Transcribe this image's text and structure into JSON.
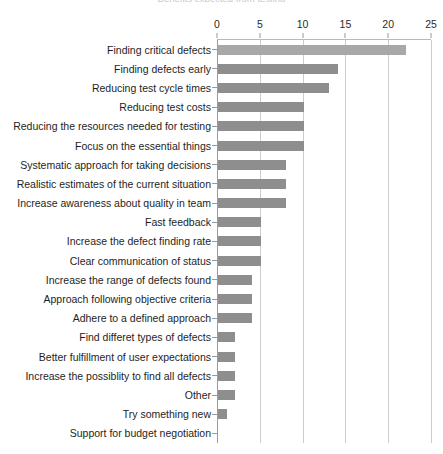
{
  "title": "Benefits expected from testing",
  "axis": {
    "ticks": [
      {
        "value": 0,
        "label": "0"
      },
      {
        "value": 5,
        "label": "5"
      },
      {
        "value": 10,
        "label": "10"
      },
      {
        "value": 15,
        "label": "15"
      },
      {
        "value": 20,
        "label": "20"
      },
      {
        "value": 25,
        "label": "25"
      }
    ]
  },
  "colors": {
    "bar": "#8e8e8e",
    "bar_light": "#a8a8a8",
    "grid": "#cccccc",
    "axis": "#9a9a9a",
    "text": "#1e1e1e"
  },
  "chart_data": {
    "type": "bar",
    "orientation": "horizontal",
    "title": "",
    "xlabel": "",
    "ylabel": "",
    "xlim": [
      0,
      25
    ],
    "grid": true,
    "legend": "none",
    "categories": [
      "Finding critical defects",
      "Finding defects early",
      "Reducing test cycle times",
      "Reducing test costs",
      "Reducing the resources needed for testing",
      "Focus on the essential things",
      "Systematic approach for taking decisions",
      "Realistic estimates of the current situation",
      "Increase awareness about quality in team",
      "Fast feedback",
      "Increase the defect finding rate",
      "Clear communication of status",
      "Increase the range of defects found",
      "Approach following objective criteria",
      "Adhere to a defined approach",
      "Find differet types of defects",
      "Better fulfillment of user expectations",
      "Increase the possiblity to find all defects",
      "Other",
      "Try something new",
      "Support for budget negotiation"
    ],
    "values": [
      22,
      14,
      13,
      10,
      10,
      10,
      8,
      8,
      8,
      5,
      5,
      5,
      4,
      4,
      4,
      2,
      2,
      2,
      2,
      1,
      0
    ]
  }
}
